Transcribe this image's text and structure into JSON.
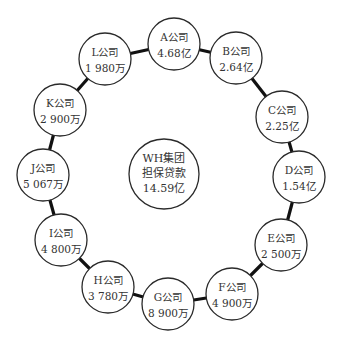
{
  "center": {
    "lines": [
      "WH集团",
      "担保贷款",
      "14.59亿"
    ],
    "x": 164,
    "y": 174,
    "r": 35
  },
  "nodes": [
    {
      "id": "A",
      "name": "A公司",
      "value": "4.68亿",
      "x": 174,
      "y": 44
    },
    {
      "id": "B",
      "name": "B公司",
      "value": "2.64亿",
      "x": 236,
      "y": 58
    },
    {
      "id": "C",
      "name": "C公司",
      "value": "2.25亿",
      "x": 282,
      "y": 117
    },
    {
      "id": "D",
      "name": "D公司",
      "value": "1.54亿",
      "x": 299,
      "y": 177
    },
    {
      "id": "E",
      "name": "E公司",
      "value": "2 500万",
      "x": 281,
      "y": 245
    },
    {
      "id": "F",
      "name": "F公司",
      "value": "4 900万",
      "x": 232,
      "y": 294
    },
    {
      "id": "G",
      "name": "G公司",
      "value": "8 900万",
      "x": 168,
      "y": 304
    },
    {
      "id": "H",
      "name": "H公司",
      "value": "3 780万",
      "x": 108,
      "y": 287
    },
    {
      "id": "I",
      "name": "I公司",
      "value": "4 800万",
      "x": 61,
      "y": 240
    },
    {
      "id": "J",
      "name": "J公司",
      "value": "5 067万",
      "x": 43,
      "y": 175
    },
    {
      "id": "K",
      "name": "K公司",
      "value": "2 900万",
      "x": 60,
      "y": 110
    },
    {
      "id": "L",
      "name": "L公司",
      "value": "1 980万",
      "x": 105,
      "y": 59
    }
  ],
  "node_radius": 26,
  "colors": {
    "link": "#111111",
    "circle_stroke": "#2a2a2a",
    "text": "#333333",
    "background": "#ffffff"
  }
}
